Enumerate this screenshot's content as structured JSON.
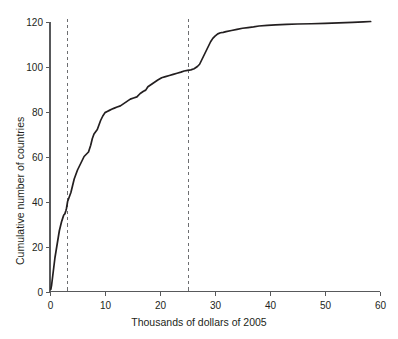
{
  "chart_data": {
    "type": "line",
    "title": "",
    "subtitle": "",
    "xlabel": "Thousands of dollars of 2005",
    "ylabel": "Cumulative number of countries",
    "xlim": [
      0,
      60
    ],
    "ylim": [
      0,
      120
    ],
    "grid": false,
    "legend": null,
    "x_ticks": [
      0,
      10,
      20,
      30,
      40,
      50,
      60
    ],
    "x_tick_labels": [
      "0",
      "10",
      "20",
      "30",
      "40",
      "50",
      "60"
    ],
    "y_ticks": [
      0,
      20,
      40,
      60,
      80,
      100,
      120
    ],
    "y_tick_labels": [
      "0",
      "20",
      "40",
      "60",
      "80",
      "100",
      "120"
    ],
    "annotations": [
      {
        "type": "vline",
        "x": 3,
        "style": "dashed",
        "label": ""
      },
      {
        "type": "vline",
        "x": 25,
        "style": "dashed",
        "label": ""
      }
    ],
    "series": [
      {
        "name": "Cumulative distribution of countries by GDP per capita",
        "x": [
          0.15,
          0.3,
          0.5,
          0.7,
          0.9,
          1.1,
          1.3,
          1.5,
          1.7,
          1.9,
          2.1,
          2.3,
          2.5,
          2.7,
          2.9,
          3.0,
          3.2,
          3.5,
          3.8,
          4.1,
          4.4,
          4.7,
          5.0,
          5.4,
          5.8,
          6.2,
          6.6,
          7.0,
          7.4,
          7.7,
          8.0,
          8.3,
          8.6,
          8.9,
          9.2,
          9.6,
          10.0,
          10.4,
          10.8,
          11.2,
          11.7,
          12.2,
          12.8,
          13.4,
          14.0,
          14.6,
          15.2,
          15.8,
          16.4,
          17.0,
          17.4,
          17.8,
          18.4,
          19.0,
          19.6,
          20.3,
          21.0,
          21.7,
          22.4,
          23.1,
          23.8,
          24.4,
          25.0,
          25.6,
          26.2,
          26.8,
          27.2,
          27.6,
          28.0,
          28.4,
          28.8,
          29.2,
          29.6,
          30.0,
          30.5,
          31.0,
          31.5,
          32.0,
          33.0,
          34.0,
          35.0,
          36.0,
          37.0,
          38.0,
          39.5,
          41.0,
          43.0,
          45.0,
          47.5,
          50.0,
          52.5,
          55.0,
          57.0,
          58.3
        ],
        "y": [
          1,
          3,
          7,
          11,
          15,
          18,
          21,
          24,
          27,
          29,
          31,
          32.5,
          34,
          34.5,
          36,
          37,
          40,
          42,
          44,
          47,
          50,
          52,
          54,
          56,
          58,
          60,
          61,
          62,
          65,
          68,
          70,
          71,
          72,
          74,
          76,
          78,
          79.5,
          80,
          80.5,
          81,
          81.5,
          82,
          82.5,
          83.5,
          84.5,
          85.5,
          86,
          86.5,
          88,
          89,
          89.5,
          91,
          92,
          93,
          94,
          95,
          95.5,
          96,
          96.5,
          97,
          97.5,
          98,
          98.3,
          98.5,
          99,
          100,
          101,
          103,
          105,
          107,
          109,
          111,
          112.5,
          113.5,
          114.5,
          115,
          115.2,
          115.5,
          116,
          116.5,
          117,
          117.3,
          117.6,
          118,
          118.3,
          118.5,
          118.7,
          118.9,
          119,
          119.2,
          119.4,
          119.6,
          119.8,
          120
        ]
      }
    ]
  },
  "axes": {
    "x_title": "Thousands of dollars of 2005",
    "y_title": "Cumulative number of countries"
  }
}
